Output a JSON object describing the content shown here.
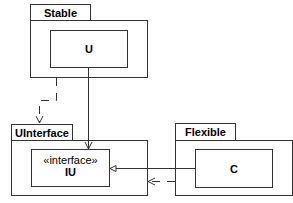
{
  "packages": {
    "stable": {
      "label": "Stable",
      "class": "U"
    },
    "uinterface": {
      "label": "UInterface",
      "stereotype": "«interface»",
      "class": "IU"
    },
    "flexible": {
      "label": "Flexible",
      "class": "C"
    }
  },
  "colors": {
    "stroke": "#333333",
    "background": "#ffffff"
  }
}
